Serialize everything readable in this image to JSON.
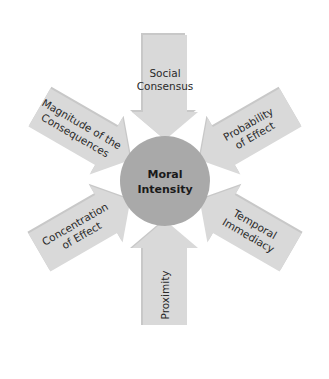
{
  "diagram": {
    "title": "Moral Intensity",
    "center": {
      "line1": "Moral",
      "line2": "Intensity",
      "color": "#a9a9a9"
    },
    "arrow_color": "#d9d9d9",
    "factors": [
      {
        "id": "social-consensus",
        "line1": "Social",
        "line2": "Consensus",
        "angle": -90
      },
      {
        "id": "probability-of-effect",
        "line1": "Probability",
        "line2": "of Effect",
        "angle": -30
      },
      {
        "id": "temporal-immediacy",
        "line1": "Temporal",
        "line2": "Immediacy",
        "angle": 30
      },
      {
        "id": "proximity",
        "line1": "Proximity",
        "line2": "",
        "angle": 90
      },
      {
        "id": "concentration-of-effect",
        "line1": "Concentration",
        "line2": "of Effect",
        "angle": 150
      },
      {
        "id": "magnitude-of-the-consequences",
        "line1": "Magnitude of the",
        "line2": "Consequences",
        "angle": -150
      }
    ]
  }
}
